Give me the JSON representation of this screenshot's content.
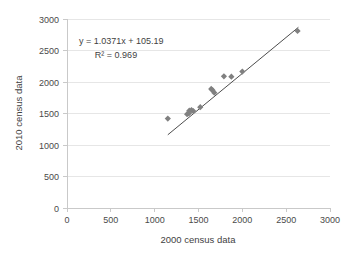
{
  "chart_data": {
    "type": "scatter",
    "title": "",
    "xlabel": "2000 census data",
    "ylabel": "2010 census data",
    "xlim": [
      0,
      3000
    ],
    "ylim": [
      0,
      3000
    ],
    "xticks": [
      0,
      500,
      1000,
      1500,
      2000,
      2500,
      3000
    ],
    "yticks": [
      0,
      500,
      1000,
      1500,
      2000,
      2500,
      3000
    ],
    "xtick_labels": [
      "0",
      "500",
      "1000",
      "1500",
      "2000",
      "2500",
      "3000"
    ],
    "ytick_labels": [
      "0",
      "500",
      "1000",
      "1500",
      "2000",
      "2500",
      "3000"
    ],
    "grid": "horizontal",
    "legend": "none",
    "marker_shape": "diamond",
    "marker_color": "#808080",
    "trendline_color": "#4d4d4d",
    "series": [
      {
        "name": "census comparison",
        "points": [
          [
            1150,
            1420
          ],
          [
            1370,
            1490
          ],
          [
            1390,
            1500
          ],
          [
            1395,
            1545
          ],
          [
            1420,
            1555
          ],
          [
            1440,
            1540
          ],
          [
            1520,
            1600
          ],
          [
            1645,
            1890
          ],
          [
            1660,
            1870
          ],
          [
            1680,
            1830
          ],
          [
            1790,
            2090
          ],
          [
            1875,
            2085
          ],
          [
            2000,
            2165
          ],
          [
            2630,
            2810
          ]
        ]
      }
    ],
    "trendline": {
      "slope": 1.0371,
      "intercept": 105.19,
      "r_squared": 0.969,
      "x_start": 1150,
      "x_end": 2640
    },
    "annotations": {
      "equation": "y = 1.0371x + 105.19",
      "r2": "R² = 0.969"
    }
  },
  "axes": {
    "x_title": "2000 census data",
    "y_title": "2010 census data",
    "x_tick_0": "0",
    "x_tick_1": "500",
    "x_tick_2": "1000",
    "x_tick_3": "1500",
    "x_tick_4": "2000",
    "x_tick_5": "2500",
    "x_tick_6": "3000",
    "y_tick_0": "0",
    "y_tick_1": "500",
    "y_tick_2": "1000",
    "y_tick_3": "1500",
    "y_tick_4": "2000",
    "y_tick_5": "2500",
    "y_tick_6": "3000"
  },
  "annotations": {
    "equation": "y = 1.0371x + 105.19",
    "r2": "R² = 0.969"
  }
}
